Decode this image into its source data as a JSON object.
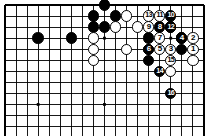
{
  "figure": {
    "name": "go-board-diagram",
    "type": "go-game-record",
    "width": 209,
    "height": 136,
    "background_color": "#ffffff",
    "line_color": "#000000",
    "black_color": "#000000",
    "white_color": "#ffffff"
  },
  "board": {
    "origin_x": 5,
    "origin_y": 5,
    "spacing": 11.05,
    "cols_visible": 19,
    "rows_visible": 12,
    "edges": {
      "top": true,
      "left": true,
      "right": true,
      "bottom": false
    },
    "star_points": [
      {
        "col": 3,
        "row": 9
      },
      {
        "col": 9,
        "row": 3
      },
      {
        "col": 9,
        "row": 9
      },
      {
        "col": 15,
        "row": 3
      }
    ]
  },
  "stones": [
    {
      "id": "b-c9r0",
      "color": "black",
      "col": 9,
      "row": 0,
      "label": ""
    },
    {
      "id": "b-c8r1",
      "color": "black",
      "col": 8,
      "row": 1,
      "label": ""
    },
    {
      "id": "b-c10r1",
      "color": "black",
      "col": 10,
      "row": 1,
      "label": ""
    },
    {
      "id": "w-c11r1",
      "color": "white",
      "col": 11,
      "row": 1,
      "label": ""
    },
    {
      "id": "b-c8r2",
      "color": "black",
      "col": 8,
      "row": 2,
      "label": ""
    },
    {
      "id": "b-c9r2",
      "color": "black",
      "col": 9,
      "row": 2,
      "label": ""
    },
    {
      "id": "w-c10r2",
      "color": "white",
      "col": 10,
      "row": 2,
      "label": ""
    },
    {
      "id": "w-c12r2",
      "color": "white",
      "col": 12,
      "row": 2,
      "label": ""
    },
    {
      "id": "b-c3r3",
      "color": "black",
      "col": 3,
      "row": 3,
      "label": ""
    },
    {
      "id": "b-c6r3",
      "color": "black",
      "col": 6,
      "row": 3,
      "label": ""
    },
    {
      "id": "w-c8r3",
      "color": "white",
      "col": 8,
      "row": 3,
      "label": ""
    },
    {
      "id": "w-c8r4",
      "color": "white",
      "col": 8,
      "row": 4,
      "label": ""
    },
    {
      "id": "w-c11r4",
      "color": "white",
      "col": 11,
      "row": 4,
      "label": ""
    },
    {
      "id": "w-c8r5",
      "color": "white",
      "col": 8,
      "row": 5,
      "label": ""
    },
    {
      "id": "b-c13r3",
      "color": "black",
      "col": 13,
      "row": 3,
      "label": ""
    },
    {
      "id": "b-c15r2",
      "color": "black",
      "col": 15,
      "row": 2,
      "label": ""
    },
    {
      "id": "b-c16r3",
      "color": "black",
      "col": 16,
      "row": 3,
      "label": ""
    },
    {
      "id": "b-c13r4",
      "color": "black",
      "col": 13,
      "row": 4,
      "label": ""
    },
    {
      "id": "b-c13r5",
      "color": "black",
      "col": 13,
      "row": 5,
      "label": ""
    },
    {
      "id": "b-c16r4",
      "color": "black",
      "col": 16,
      "row": 4,
      "label": ""
    },
    {
      "id": "w-c17r5",
      "color": "white",
      "col": 17,
      "row": 5,
      "label": ""
    },
    {
      "id": "w-c15r6",
      "color": "white",
      "col": 15,
      "row": 6,
      "label": ""
    },
    {
      "id": "m1",
      "color": "white",
      "col": 17,
      "row": 4,
      "label": "1"
    },
    {
      "id": "m2",
      "color": "white",
      "col": 17,
      "row": 3,
      "label": "2"
    },
    {
      "id": "m3",
      "color": "white",
      "col": 15,
      "row": 4,
      "label": "3"
    },
    {
      "id": "m4",
      "color": "black",
      "col": 16,
      "row": 3,
      "label": "4"
    },
    {
      "id": "m5",
      "color": "white",
      "col": 14,
      "row": 4,
      "label": "5"
    },
    {
      "id": "m6",
      "color": "black",
      "col": 13,
      "row": 4,
      "label": "6"
    },
    {
      "id": "m7",
      "color": "white",
      "col": 14,
      "row": 3,
      "label": "7"
    },
    {
      "id": "m8",
      "color": "black",
      "col": 14,
      "row": 2,
      "label": "8"
    },
    {
      "id": "m9",
      "color": "white",
      "col": 13,
      "row": 2,
      "label": "9"
    },
    {
      "id": "m10",
      "color": "black",
      "col": 15,
      "row": 1,
      "label": "10"
    },
    {
      "id": "m11",
      "color": "white",
      "col": 14,
      "row": 1,
      "label": "11"
    },
    {
      "id": "m12",
      "color": "black",
      "col": 15,
      "row": 2,
      "label": "12"
    },
    {
      "id": "m13",
      "color": "white",
      "col": 13,
      "row": 1,
      "label": "13"
    },
    {
      "id": "m14",
      "color": "black",
      "col": 14,
      "row": 6,
      "label": "14"
    },
    {
      "id": "m15",
      "color": "white",
      "col": 15,
      "row": 5,
      "label": "15"
    },
    {
      "id": "m16",
      "color": "black",
      "col": 15,
      "row": 8,
      "label": "16"
    }
  ]
}
